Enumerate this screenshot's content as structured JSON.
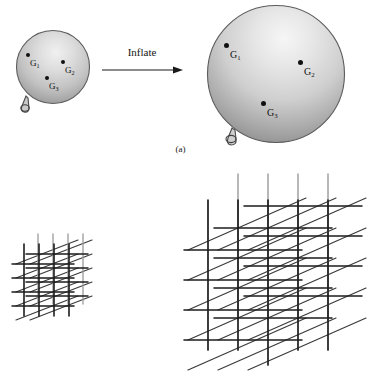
{
  "figure": {
    "title_caption": "(a)",
    "panels": [
      {
        "id": "a",
        "caption": "(a)",
        "transition_label": "Inflate",
        "objects": [
          {
            "name": "balloon-small",
            "state": "deflated",
            "radius_px": 38,
            "markers": [
              {
                "label": "G",
                "subscript": "1"
              },
              {
                "label": "G",
                "subscript": "2"
              },
              {
                "label": "G",
                "subscript": "3"
              }
            ]
          },
          {
            "name": "balloon-large",
            "state": "inflated",
            "radius_px": 77,
            "markers": [
              {
                "label": "G",
                "subscript": "1"
              },
              {
                "label": "G",
                "subscript": "2"
              },
              {
                "label": "G",
                "subscript": "3"
              }
            ]
          }
        ]
      },
      {
        "id": "b",
        "caption": "",
        "objects": [
          {
            "name": "lattice-small",
            "state": "unexpanded",
            "cells": 4,
            "spacing_px": 20
          },
          {
            "name": "lattice-large",
            "state": "expanded",
            "cells": 4,
            "spacing_px": 40
          }
        ]
      }
    ]
  },
  "labels": {
    "g1": "G",
    "g1_sub": "1",
    "g2": "G",
    "g2_sub": "2",
    "g3": "G",
    "g3_sub": "3",
    "inflate": "Inflate",
    "caption_a": "(a)"
  },
  "colors": {
    "background": "#ffffff",
    "balloon_highlight": "#f4f4f4",
    "balloon_mid": "#c8c8c8",
    "balloon_shadow": "#848484",
    "balloon_edge": "#5a5a5a",
    "marker": "#101010",
    "text": "#141414",
    "lattice_dark": "#1c1c1c",
    "lattice_mid": "#6a6a6a",
    "lattice_light": "#9a9a9a"
  }
}
